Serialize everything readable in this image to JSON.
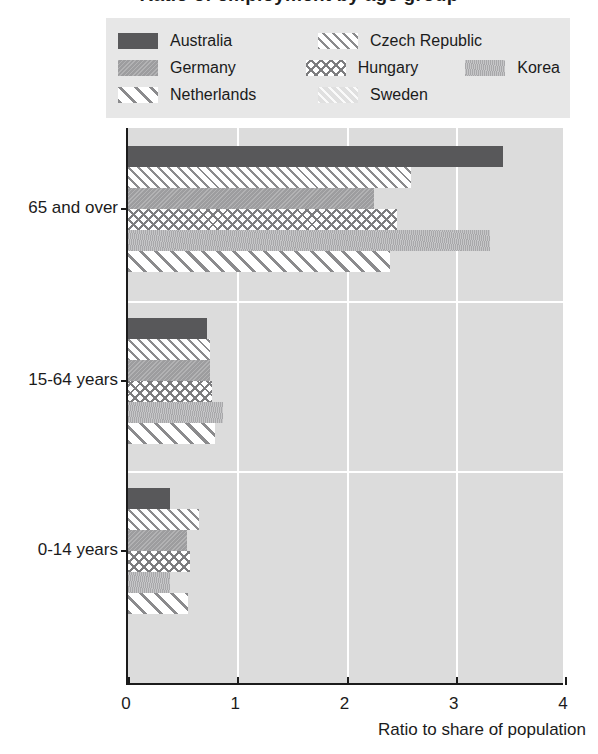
{
  "title": "Ratio of employment by age group",
  "legend": {
    "rows": [
      [
        {
          "label": "Australia",
          "pattern": "p-australia",
          "icon": "legend-swatch-solid-dark"
        },
        {
          "label": "Czech Republic",
          "pattern": "p-czech",
          "icon": "legend-swatch-fine-diagonal"
        }
      ],
      [
        {
          "label": "Germany",
          "pattern": "p-germany",
          "icon": "legend-swatch-medium-gray"
        },
        {
          "label": "Hungary",
          "pattern": "p-hungary",
          "icon": "legend-swatch-crosshatch"
        },
        {
          "label": "Korea",
          "pattern": "p-korea",
          "icon": "legend-swatch-light-gray-texture"
        }
      ],
      [
        {
          "label": "Netherlands",
          "pattern": "p-netherlands",
          "icon": "legend-swatch-wide-diagonal"
        },
        {
          "label": "Sweden",
          "pattern": "p-sweden",
          "icon": "legend-swatch-very-light"
        }
      ]
    ]
  },
  "axis": {
    "x_title": "Ratio to share of population",
    "x_ticks": [
      "0",
      "1",
      "2",
      "3",
      "4"
    ],
    "y_categories": [
      "65 and over",
      "15-64 years",
      "0-14 years"
    ]
  },
  "colors": {
    "plot_background": "#dcdcdc",
    "legend_background": "#e7e7e7",
    "axis": "#1b1b1b",
    "gridline": "#ffffff",
    "australia": "#58585a",
    "germany": "#9d9d9f",
    "korea": "#a8a8aa",
    "sweden": "#e0e0e0"
  },
  "chart_data": {
    "type": "bar",
    "orientation": "horizontal",
    "title": "Ratio of employment by age group",
    "xlabel": "Ratio to share of population",
    "ylabel": "",
    "xlim": [
      0,
      4
    ],
    "xticks": [
      0,
      1,
      2,
      3,
      4
    ],
    "grid": true,
    "legend_position": "top",
    "categories": [
      "65 and over",
      "15-64 years",
      "0-14 years"
    ],
    "series": [
      {
        "name": "Australia",
        "pattern": "p-australia",
        "values": [
          3.43,
          0.72,
          0.38
        ]
      },
      {
        "name": "Czech Republic",
        "pattern": "p-czech",
        "values": [
          2.59,
          0.75,
          0.65
        ]
      },
      {
        "name": "Germany",
        "pattern": "p-germany",
        "values": [
          2.25,
          0.75,
          0.54
        ]
      },
      {
        "name": "Hungary",
        "pattern": "p-hungary",
        "values": [
          2.46,
          0.77,
          0.57
        ]
      },
      {
        "name": "Korea",
        "pattern": "p-korea",
        "values": [
          3.31,
          0.87,
          0.38
        ]
      },
      {
        "name": "Netherlands",
        "pattern": "p-netherlands",
        "values": [
          2.4,
          0.8,
          0.55
        ]
      },
      {
        "name": "Sweden",
        "pattern": "p-sweden",
        "values": [
          null,
          null,
          null
        ]
      }
    ]
  }
}
